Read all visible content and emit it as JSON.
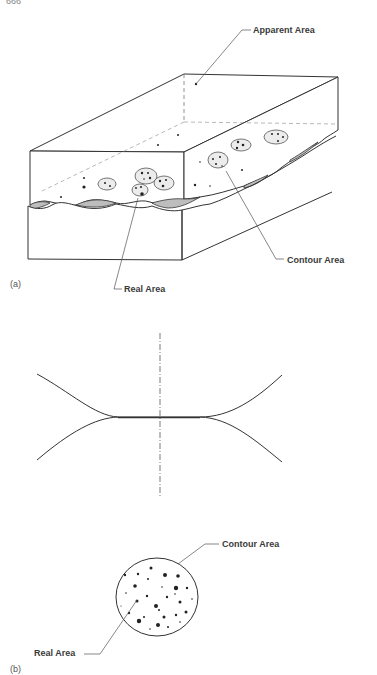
{
  "page": {
    "number": "666"
  },
  "figure_a": {
    "part_label": "(a)",
    "labels": {
      "apparent_area": "Apparent Area",
      "contour_area": "Contour Area",
      "real_area": "Real Area"
    }
  },
  "figure_b": {
    "part_label": "(b)",
    "labels": {
      "contour_area": "Contour Area",
      "real_area": "Real Area"
    }
  },
  "colors": {
    "line": "#333333",
    "leader": "#555555",
    "gap_fill": "#bdbdbd",
    "contour_fill": "#ececec",
    "spot": "#222222"
  }
}
